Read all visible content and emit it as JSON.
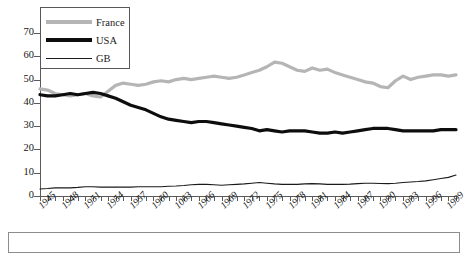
{
  "legend": {
    "position": "top-left-inside",
    "entries": [
      {
        "label": "France",
        "color": "#b5b5b5",
        "style": "thick"
      },
      {
        "label": "USA",
        "color": "#0d0d0d",
        "style": "thick"
      },
      {
        "label": "GB",
        "color": "#1a1a1a",
        "style": "thin"
      }
    ]
  },
  "caption": {
    "text": ""
  },
  "chart_data": {
    "type": "line",
    "title": "",
    "xlabel": "",
    "ylabel": "",
    "xlim": [
      1945,
      2000
    ],
    "ylim": [
      0,
      70
    ],
    "yticks": [
      0,
      10,
      20,
      30,
      40,
      50,
      60,
      70
    ],
    "ytick_labels": [
      "0",
      "10",
      "20",
      "30",
      "40",
      "50",
      "60",
      "70"
    ],
    "xtick_labels": [
      "1945",
      "1948",
      "1951",
      "1954",
      "1957",
      "1960",
      "1063",
      "1966",
      "1969",
      "1972",
      "1975",
      "1978",
      "1981",
      "1984",
      "1987",
      "1990",
      "1993",
      "1996",
      "1999"
    ],
    "xtick_interval": 3,
    "xtick_minor_interval": 1,
    "grid": false,
    "legend_position": "upper left",
    "x": [
      1945,
      1946,
      1947,
      1948,
      1949,
      1950,
      1951,
      1952,
      1953,
      1954,
      1955,
      1956,
      1957,
      1958,
      1959,
      1960,
      1961,
      1962,
      1963,
      1964,
      1965,
      1966,
      1967,
      1968,
      1969,
      1970,
      1971,
      1972,
      1973,
      1974,
      1975,
      1976,
      1977,
      1978,
      1979,
      1980,
      1981,
      1982,
      1983,
      1984,
      1985,
      1986,
      1987,
      1988,
      1989,
      1990,
      1991,
      1992,
      1993,
      1994,
      1995,
      1996,
      1997,
      1998,
      1999,
      2000
    ],
    "series": [
      {
        "name": "France",
        "color": "#b5b5b5",
        "linewidth": 3.2,
        "values": [
          46,
          45.5,
          44,
          43.5,
          43,
          43.5,
          44,
          43,
          42.5,
          45,
          47.5,
          48.5,
          48,
          47.5,
          48,
          49,
          49.5,
          49,
          50,
          50.5,
          50,
          50.5,
          51,
          51.5,
          51,
          50.5,
          51,
          52,
          53,
          54,
          55.5,
          57.5,
          57,
          55.5,
          54,
          53.5,
          55,
          54,
          54.5,
          53,
          52,
          51,
          50,
          49,
          48.5,
          47,
          46.5,
          49.5,
          51.5,
          50,
          51,
          51.5,
          52,
          52,
          51.5,
          52
        ]
      },
      {
        "name": "USA",
        "color": "#0d0d0d",
        "linewidth": 3.2,
        "values": [
          43.5,
          43,
          43,
          43.5,
          44,
          43.5,
          44,
          44.5,
          44,
          43,
          42,
          40.5,
          39,
          38,
          37,
          35.5,
          34,
          33,
          32.5,
          32,
          31.5,
          32,
          32,
          31.5,
          31,
          30.5,
          30,
          29.5,
          29,
          28,
          28.5,
          28,
          27.5,
          28,
          28,
          28,
          27.5,
          27,
          27,
          27.5,
          27,
          27.5,
          28,
          28.5,
          29,
          29,
          29,
          28.5,
          28,
          28,
          28,
          28,
          28,
          28.5,
          28.5,
          28.5
        ]
      },
      {
        "name": "GB",
        "color": "#1a1a1a",
        "linewidth": 1.1,
        "values": [
          3,
          3.2,
          3.5,
          3.5,
          3.5,
          3.7,
          4,
          4,
          3.8,
          3.8,
          3.8,
          3.8,
          3.8,
          4,
          4,
          4,
          4,
          4.2,
          4.3,
          4.5,
          4.8,
          5,
          5,
          4.8,
          4.6,
          4.8,
          5,
          5.2,
          5.5,
          5.8,
          5.5,
          5.2,
          5,
          5,
          5,
          5.2,
          5.3,
          5.2,
          5,
          5,
          5,
          5.1,
          5.3,
          5.5,
          5.5,
          5.4,
          5.3,
          5.5,
          5.8,
          6,
          6.2,
          6.5,
          7,
          7.5,
          8,
          9
        ]
      }
    ]
  }
}
